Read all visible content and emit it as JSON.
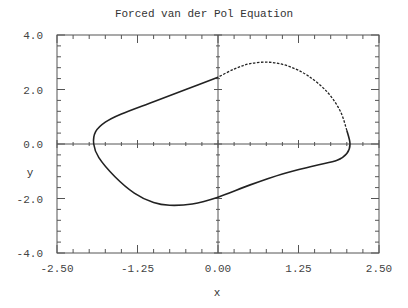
{
  "chart_data": {
    "type": "line",
    "title": "Forced van der Pol Equation",
    "xlabel": "x",
    "ylabel": "y",
    "xlim": [
      -2.5,
      2.5
    ],
    "ylim": [
      -4.0,
      4.0
    ],
    "x_ticks": [
      "-2.50",
      "-1.25",
      "0.00",
      "1.25",
      "2.50"
    ],
    "y_ticks": [
      "4.0",
      "2.0",
      "0.0",
      "-2.0",
      "-4.0"
    ],
    "grid": false,
    "axes_through_origin": true,
    "series": [
      {
        "name": "limit cycle (solid)",
        "style": "solid",
        "points": [
          [
            0.0,
            2.45
          ],
          [
            -0.5,
            2.0
          ],
          [
            -1.0,
            1.55
          ],
          [
            -1.5,
            1.1
          ],
          [
            -1.75,
            0.8
          ],
          [
            -1.9,
            0.45
          ],
          [
            -1.93,
            0.0
          ],
          [
            -1.85,
            -0.5
          ],
          [
            -1.6,
            -1.2
          ],
          [
            -1.3,
            -1.8
          ],
          [
            -1.0,
            -2.15
          ],
          [
            -0.75,
            -2.25
          ],
          [
            -0.4,
            -2.2
          ],
          [
            0.0,
            -1.95
          ],
          [
            0.5,
            -1.5
          ],
          [
            1.0,
            -1.1
          ],
          [
            1.5,
            -0.8
          ],
          [
            1.85,
            -0.6
          ],
          [
            2.0,
            -0.35
          ],
          [
            2.05,
            0.0
          ],
          [
            2.0,
            0.5
          ]
        ]
      },
      {
        "name": "limit cycle (dashed)",
        "style": "dashed",
        "points": [
          [
            2.0,
            0.5
          ],
          [
            1.9,
            1.2
          ],
          [
            1.7,
            1.9
          ],
          [
            1.4,
            2.5
          ],
          [
            1.1,
            2.85
          ],
          [
            0.8,
            3.0
          ],
          [
            0.5,
            2.95
          ],
          [
            0.25,
            2.75
          ],
          [
            0.0,
            2.45
          ]
        ]
      }
    ]
  }
}
